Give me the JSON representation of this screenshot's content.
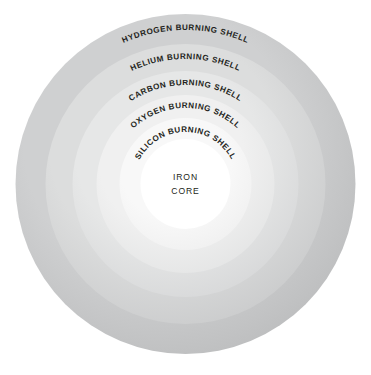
{
  "diagram": {
    "background_color": "#ffffff",
    "center_x": 185.5,
    "center_y": 184,
    "outer_radius": 170
  },
  "chart_data": {
    "type": "pie",
    "layout": "concentric-rings",
    "legend_position": "on-figure-curved-labels",
    "categories": [
      "HYDROGEN BURNING SHELL",
      "HELIUM BURNING SHELL",
      "CARBON BURNING SHELL",
      "OXYGEN BURNING SHELL",
      "SILICON BURNING SHELL",
      "IRON CORE"
    ],
    "values": [
      170,
      140,
      113,
      89,
      66,
      45
    ],
    "ylabel": "Radius (px)",
    "xlabel": "",
    "series": [
      {
        "name": "ring_outer_radius",
        "values": [
          170,
          140,
          113,
          89,
          66,
          45
        ]
      }
    ]
  },
  "shells": [
    {
      "id": "hydrogen",
      "label": "HYDROGEN BURNING SHELL",
      "radius": 170,
      "color": "#b9babb",
      "color_light": "#cfd0d1",
      "label_arc_radius": 154,
      "label_font_size": 8.1
    },
    {
      "id": "helium",
      "label": "HELIUM BURNING SHELL",
      "radius": 140,
      "color": "#c7c8c9",
      "color_light": "#dcdddd",
      "label_arc_radius": 125,
      "label_font_size": 8.1
    },
    {
      "id": "carbon",
      "label": "CARBON BURNING SHELL",
      "radius": 113,
      "color": "#d4d5d6",
      "color_light": "#e6e7e7",
      "label_arc_radius": 99,
      "label_font_size": 8.1
    },
    {
      "id": "oxygen",
      "label": "OXYGEN BURNING SHELL",
      "radius": 89,
      "color": "#e2e3e3",
      "color_light": "#f0f0f0",
      "label_arc_radius": 76,
      "label_font_size": 8.1
    },
    {
      "id": "silicon",
      "label": "SILICON BURNING SHELL",
      "radius": 66,
      "color": "#eeeeee",
      "color_light": "#f8f8f8",
      "label_arc_radius": 52,
      "label_font_size": 8.1
    },
    {
      "id": "iron",
      "label": "IRON CORE",
      "radius": 45,
      "color": "#ffffff",
      "color_light": "#ffffff",
      "label_arc_radius": 0,
      "label_font_size": 8.6
    }
  ],
  "core": {
    "line1": "IRON",
    "line2": "CORE",
    "text_color": "#231f20",
    "line1_y": 180,
    "line2_y": 194
  }
}
